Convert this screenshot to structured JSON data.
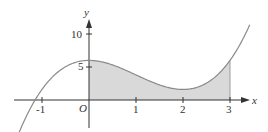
{
  "figure": {
    "type": "function-graph",
    "function_description": "Cubic curve with local max near x=0 and local min near x=2; shaded region under curve from x=0 to x=3",
    "x_axis": {
      "label": "x",
      "ticks": [
        "-1",
        "1",
        "2",
        "3"
      ]
    },
    "y_axis": {
      "label": "y",
      "ticks": [
        "5",
        "10"
      ]
    },
    "origin_label": "O",
    "shaded_interval": [
      0,
      3
    ],
    "colors": {
      "curve": "#8a8a8a",
      "shade": "#d9d9d9",
      "axis": "#333333"
    }
  },
  "chart_data": {
    "type": "line",
    "title": "",
    "xlabel": "x",
    "ylabel": "y",
    "xlim": [
      -1.5,
      3.45
    ],
    "ylim": [
      -4,
      12
    ],
    "x_ticks": [
      -1,
      1,
      2,
      3
    ],
    "y_ticks": [
      5,
      10
    ],
    "grid": false,
    "series": [
      {
        "name": "f(x)",
        "x": [
          -1.5,
          -1.15,
          -1,
          -0.5,
          0,
          0.5,
          1,
          1.5,
          2,
          2.5,
          3,
          3.43
        ],
        "y": [
          -4.0,
          0.0,
          1.6,
          5.0,
          6.0,
          5.3,
          3.8,
          2.3,
          1.6,
          2.6,
          6.0,
          11.6
        ]
      }
    ],
    "shaded_region": {
      "from_x": 0,
      "to_x": 3,
      "under": "f(x)",
      "above": "x-axis"
    },
    "annotations": [
      "O"
    ]
  }
}
